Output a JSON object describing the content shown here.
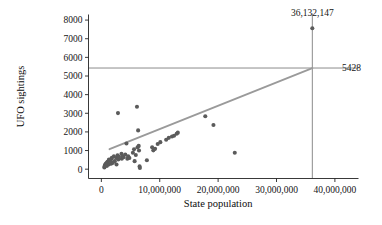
{
  "chart_data": {
    "type": "scatter",
    "title": "",
    "xlabel": "State population",
    "ylabel": "UFO sightings",
    "xlim": [
      -2200000,
      42500000
    ],
    "ylim": [
      -500,
      8300
    ],
    "xticks": [
      0,
      10000000,
      20000000,
      30000000,
      40000000
    ],
    "xtick_labels": [
      "0",
      "10,000,000",
      "20,000,000",
      "30,000,000",
      "40,000,000"
    ],
    "yticks": [
      0,
      1000,
      2000,
      3000,
      4000,
      5000,
      6000,
      7000,
      8000
    ],
    "ytick_labels": [
      "0",
      "1000",
      "2000",
      "3000",
      "4000",
      "5000",
      "6000",
      "7000",
      "8000"
    ],
    "grid": false,
    "legend": "none",
    "marker_color": "#5b5b5b",
    "line_color": "#9a9a9a",
    "reference_line_color": "#7d7d7d",
    "points": [
      {
        "x": 515004,
        "y": 90
      },
      {
        "x": 563626,
        "y": 150
      },
      {
        "x": 626932,
        "y": 205
      },
      {
        "x": 683478,
        "y": 250
      },
      {
        "x": 796214,
        "y": 300
      },
      {
        "x": 902195,
        "y": 330
      },
      {
        "x": 967803,
        "y": 180
      },
      {
        "x": 1050788,
        "y": 400
      },
      {
        "x": 1274923,
        "y": 470
      },
      {
        "x": 1314895,
        "y": 520
      },
      {
        "x": 1321505,
        "y": 260
      },
      {
        "x": 1595728,
        "y": 430
      },
      {
        "x": 1717851,
        "y": 300
      },
      {
        "x": 1747489,
        "y": 560
      },
      {
        "x": 1800011,
        "y": 610
      },
      {
        "x": 1968124,
        "y": 340
      },
      {
        "x": 2150000,
        "y": 690
      },
      {
        "x": 2300000,
        "y": 430
      },
      {
        "x": 2550000,
        "y": 600
      },
      {
        "x": 2600000,
        "y": 250
      },
      {
        "x": 2775000,
        "y": 740
      },
      {
        "x": 2850000,
        "y": 3010
      },
      {
        "x": 2900000,
        "y": 520
      },
      {
        "x": 3000000,
        "y": 660
      },
      {
        "x": 3450000,
        "y": 830
      },
      {
        "x": 3500000,
        "y": 560
      },
      {
        "x": 3600000,
        "y": 700
      },
      {
        "x": 3800000,
        "y": 640
      },
      {
        "x": 4100000,
        "y": 790
      },
      {
        "x": 4300000,
        "y": 1380
      },
      {
        "x": 4450000,
        "y": 560
      },
      {
        "x": 4600000,
        "y": 690
      },
      {
        "x": 4800000,
        "y": 600
      },
      {
        "x": 5400000,
        "y": 880
      },
      {
        "x": 5600000,
        "y": 1070
      },
      {
        "x": 5700000,
        "y": 430
      },
      {
        "x": 5900000,
        "y": 760
      },
      {
        "x": 6100000,
        "y": 3350
      },
      {
        "x": 6200000,
        "y": 1180
      },
      {
        "x": 6300000,
        "y": 2080
      },
      {
        "x": 6400000,
        "y": 1250
      },
      {
        "x": 6450000,
        "y": 1000
      },
      {
        "x": 6550000,
        "y": 150
      },
      {
        "x": 6600000,
        "y": 60
      },
      {
        "x": 7800000,
        "y": 480
      },
      {
        "x": 8700000,
        "y": 1180
      },
      {
        "x": 8900000,
        "y": 1010
      },
      {
        "x": 9200000,
        "y": 1090
      },
      {
        "x": 9650000,
        "y": 1350
      },
      {
        "x": 10100000,
        "y": 1450
      },
      {
        "x": 11100000,
        "y": 1580
      },
      {
        "x": 11550000,
        "y": 1680
      },
      {
        "x": 12100000,
        "y": 1750
      },
      {
        "x": 12450000,
        "y": 1790
      },
      {
        "x": 12900000,
        "y": 1900
      },
      {
        "x": 13100000,
        "y": 1960
      },
      {
        "x": 17800000,
        "y": 2840
      },
      {
        "x": 19200000,
        "y": 2370
      },
      {
        "x": 22850000,
        "y": 880
      },
      {
        "x": 36132147,
        "y": 7560
      }
    ],
    "trend_line": {
      "x_start": 1400000,
      "y_start": 1075,
      "x_end": 36132147,
      "y_end": 5428
    },
    "reference_lines": {
      "horizontal_y": 5428,
      "vertical_x": 36132147
    },
    "annotations": [
      {
        "name": "population-annotation",
        "text": "36,132,147",
        "x": 36132147,
        "y": 8200
      },
      {
        "name": "prediction-annotation",
        "text": "5428",
        "x": 41200000,
        "y": 5428
      }
    ]
  },
  "page": {
    "bottom_clipped_text": ""
  }
}
